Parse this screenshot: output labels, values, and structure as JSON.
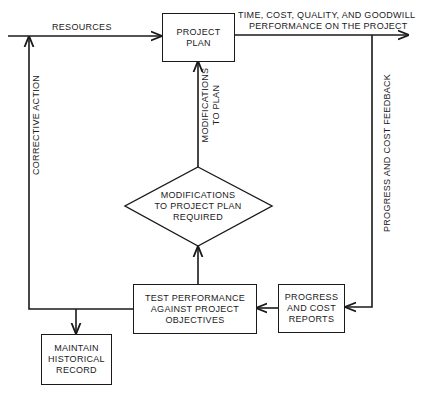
{
  "diagram": {
    "type": "flowchart",
    "nodes": {
      "project_plan": {
        "line1": "PROJECT",
        "line2": "PLAN"
      },
      "modifications_required": {
        "line1": "MODIFICATIONS",
        "line2": "TO PROJECT PLAN",
        "line3": "REQUIRED"
      },
      "test_performance": {
        "line1": "TEST PERFORMANCE",
        "line2": "AGAINST PROJECT",
        "line3": "OBJECTIVES"
      },
      "progress_reports": {
        "line1": "PROGRESS",
        "line2": "AND COST",
        "line3": "REPORTS"
      },
      "historical_record": {
        "line1": "MAINTAIN",
        "line2": "HISTORICAL",
        "line3": "RECORD"
      }
    },
    "edge_labels": {
      "resources": "RESOURCES",
      "output_line1": "TIME, COST, QUALITY, AND GOODWILL",
      "output_line2": "PERFORMANCE ON THE PROJECT",
      "modifications_to_plan_line1": "MODIFICATIONS",
      "modifications_to_plan_line2": "TO PLAN",
      "corrective_action": "CORRECTIVE ACTION",
      "progress_feedback": "PROGRESS AND COST FEEDBACK"
    },
    "edges": [
      {
        "from": "input",
        "to": "project_plan",
        "label": "RESOURCES"
      },
      {
        "from": "project_plan",
        "to": "output",
        "label": "TIME, COST, QUALITY, AND GOODWILL PERFORMANCE ON THE PROJECT"
      },
      {
        "from": "output",
        "to": "progress_reports",
        "label": "PROGRESS AND COST FEEDBACK"
      },
      {
        "from": "progress_reports",
        "to": "test_performance",
        "label": ""
      },
      {
        "from": "test_performance",
        "to": "modifications_required",
        "label": ""
      },
      {
        "from": "modifications_required",
        "to": "project_plan",
        "label": "MODIFICATIONS TO PLAN"
      },
      {
        "from": "test_performance",
        "to": "input",
        "label": "CORRECTIVE ACTION"
      },
      {
        "from": "test_performance",
        "to": "historical_record",
        "label": ""
      }
    ]
  }
}
